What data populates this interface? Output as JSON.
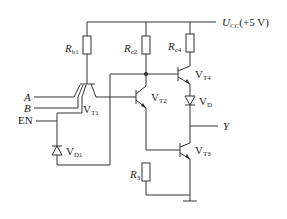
{
  "diagram": {
    "type": "TTL tri-state NAND gate circuit",
    "supply": {
      "label": "U",
      "sub": "CC",
      "value": "(+5 V)"
    },
    "resistors": [
      {
        "id": "Rb1",
        "label": "R",
        "sub": "b1"
      },
      {
        "id": "Rc2",
        "label": "R",
        "sub": "c2"
      },
      {
        "id": "Rc4",
        "label": "R",
        "sub": "c4"
      },
      {
        "id": "R3",
        "label": "R",
        "sub": "3"
      }
    ],
    "transistors": [
      {
        "id": "VT1",
        "label": "V",
        "sub": "T1",
        "kind": "multi-emitter NPN"
      },
      {
        "id": "VT2",
        "label": "V",
        "sub": "T2",
        "kind": "NPN"
      },
      {
        "id": "VT3",
        "label": "V",
        "sub": "T3",
        "kind": "NPN"
      },
      {
        "id": "VT4",
        "label": "V",
        "sub": "T4",
        "kind": "NPN"
      }
    ],
    "diodes": [
      {
        "id": "VD",
        "label": "V",
        "sub": "D"
      },
      {
        "id": "VD1",
        "label": "V",
        "sub": "D1"
      }
    ],
    "inputs": [
      "A",
      "B",
      "EN"
    ],
    "output": "Y"
  }
}
